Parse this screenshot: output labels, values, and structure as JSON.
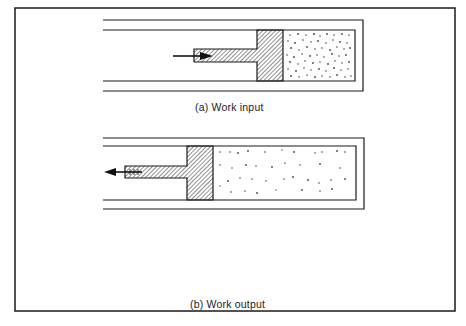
{
  "figure": {
    "panels": [
      {
        "id": "a",
        "caption": "(a)  Work input",
        "piston_direction": "right",
        "arrow": "work-input-arrow",
        "gas_state": "compressed"
      },
      {
        "id": "b",
        "caption": "(b)  Work output",
        "piston_direction": "left",
        "arrow": "work-output-arrow",
        "gas_state": "expanded",
        "heat_sources": [
          "bunsen-burner",
          "bunsen-burner",
          "bunsen-burner"
        ]
      }
    ],
    "colors": {
      "line": "#1a1a1a",
      "background": "#ffffff",
      "hatch": "#333333",
      "gas_dots": "#444444"
    }
  }
}
